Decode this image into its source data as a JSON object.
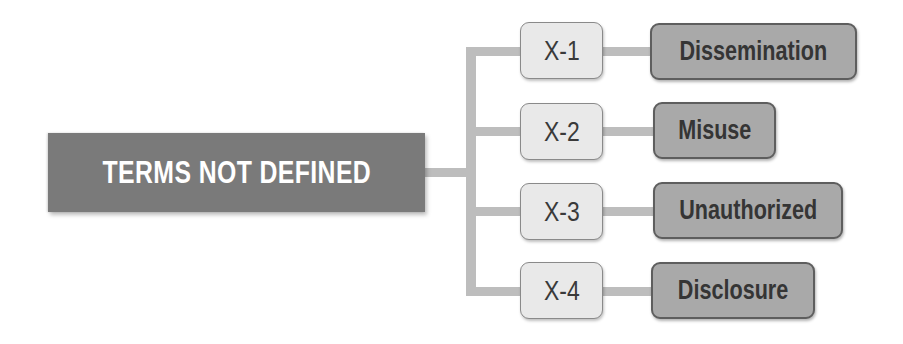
{
  "diagram": {
    "root": {
      "label": "TERMS NOT DEFINED"
    },
    "branches": [
      {
        "code": "X-1",
        "term": "Dissemination"
      },
      {
        "code": "X-2",
        "term": "Misuse"
      },
      {
        "code": "X-3",
        "term": "Unauthorized"
      },
      {
        "code": "X-4",
        "term": "Disclosure"
      }
    ],
    "colors": {
      "root_fill": "#7a7a7a",
      "root_text": "#ffffff",
      "code_fill": "#e9e9e9",
      "term_fill": "#a9a9a9",
      "term_border": "#5e5e5e",
      "connector": "#bdbdbd"
    }
  }
}
